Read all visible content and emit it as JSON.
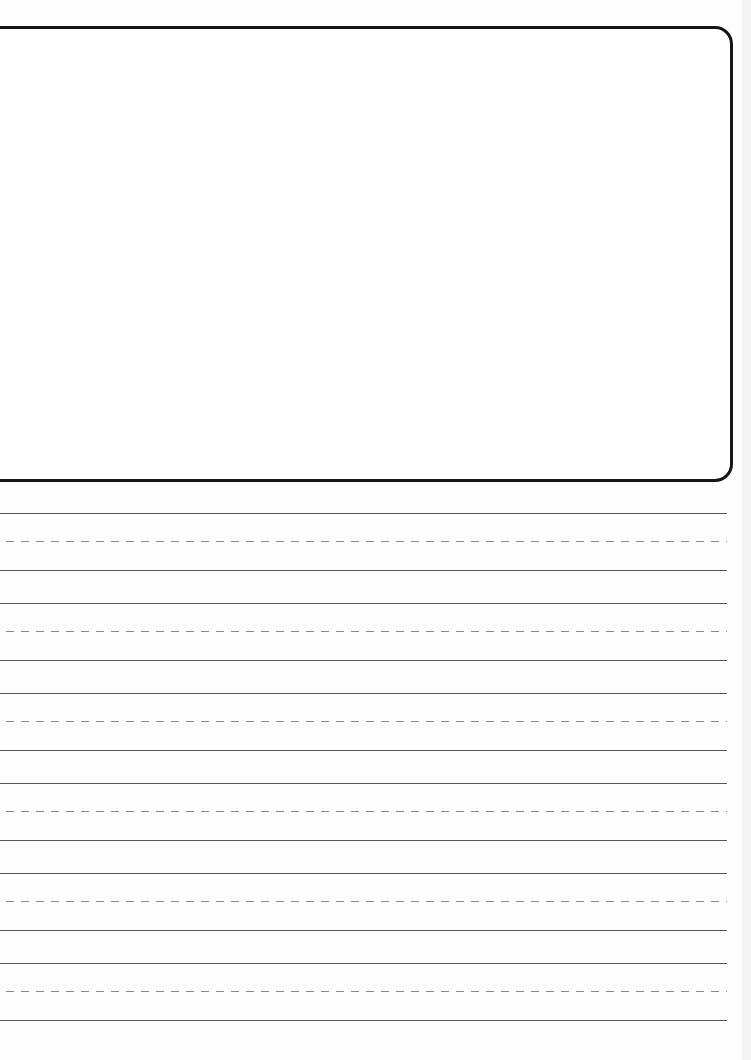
{
  "worksheet": {
    "type": "handwriting-practice-paper",
    "drawing_box": {
      "label": "",
      "border_color": "#151515"
    },
    "line_colors": {
      "solid": "#555555",
      "dashed": "#8a8a8a"
    },
    "line_groups": [
      {
        "top": 513,
        "mid": 541,
        "base": 570
      },
      {
        "top": 603,
        "mid": 631,
        "base": 660
      },
      {
        "top": 693,
        "mid": 721,
        "base": 750
      },
      {
        "top": 783,
        "mid": 811,
        "base": 840
      },
      {
        "top": 873,
        "mid": 901,
        "base": 930
      },
      {
        "top": 963,
        "mid": 991,
        "base": 1020
      }
    ]
  }
}
